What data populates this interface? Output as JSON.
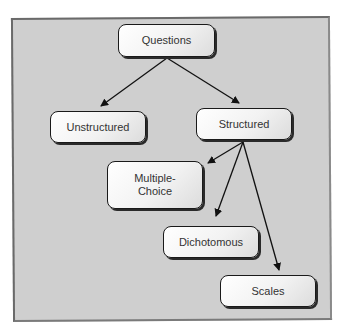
{
  "diagram": {
    "type": "tree",
    "background_color": "#cfcfcf",
    "nodes": [
      {
        "id": "questions",
        "label": "Questions"
      },
      {
        "id": "unstructured",
        "label": "Unstructured"
      },
      {
        "id": "structured",
        "label": "Structured"
      },
      {
        "id": "multiple_choice",
        "label": "Multiple-Choice",
        "line1": "Multiple-",
        "line2": "Choice"
      },
      {
        "id": "dichotomous",
        "label": "Dichotomous"
      },
      {
        "id": "scales",
        "label": "Scales"
      }
    ],
    "edges": [
      {
        "from": "questions",
        "to": "unstructured"
      },
      {
        "from": "questions",
        "to": "structured"
      },
      {
        "from": "structured",
        "to": "multiple_choice"
      },
      {
        "from": "structured",
        "to": "dichotomous"
      },
      {
        "from": "structured",
        "to": "scales"
      }
    ]
  }
}
